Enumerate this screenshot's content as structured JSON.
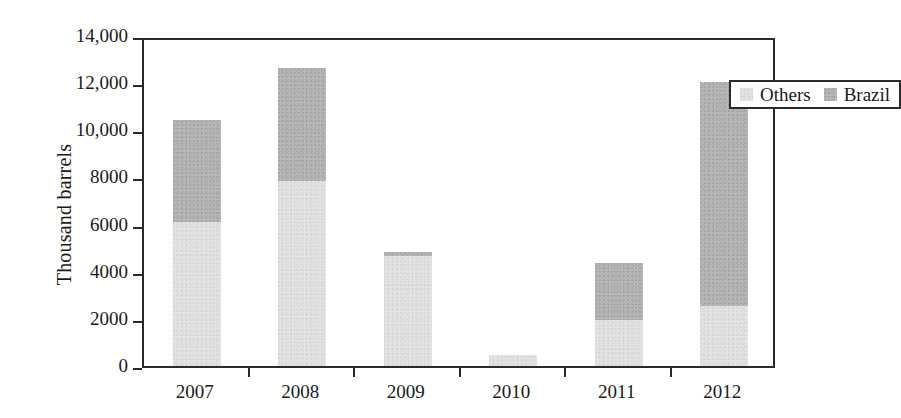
{
  "chart_data": {
    "type": "bar",
    "subtype": "stacked-bar",
    "title": "",
    "xlabel": "",
    "ylabel": "Thousand barrels",
    "categories": [
      "2007",
      "2008",
      "2009",
      "2010",
      "2011",
      "2012"
    ],
    "series": [
      {
        "name": "Others",
        "color": "#e3e3e3",
        "values": [
          6100,
          7850,
          4650,
          470,
          1950,
          2550
        ]
      },
      {
        "name": "Brazil",
        "color": "#b7b7b7",
        "values": [
          4350,
          4800,
          200,
          0,
          2400,
          9500
        ]
      }
    ],
    "totals": [
      10450,
      12650,
      4850,
      470,
      4350,
      12050
    ],
    "ylim": [
      0,
      14000
    ],
    "ytick_values": [
      0,
      2000,
      4000,
      6000,
      8000,
      10000,
      12000,
      14000
    ],
    "ytick_labels": [
      "0",
      "2000",
      "4000",
      "6000",
      "8000",
      "10,000",
      "12,000",
      "14,000"
    ],
    "grid": false,
    "legend_position": "top-right-inside",
    "legend_entries": [
      "Others",
      "Brazil"
    ],
    "stacked": true,
    "annotations": []
  },
  "axis": {
    "y_title": "Thousand barrels"
  },
  "legend": {
    "items": [
      {
        "label": "Others",
        "swatch": "#e3e3e3"
      },
      {
        "label": "Brazil",
        "swatch": "#b7b7b7"
      }
    ]
  }
}
